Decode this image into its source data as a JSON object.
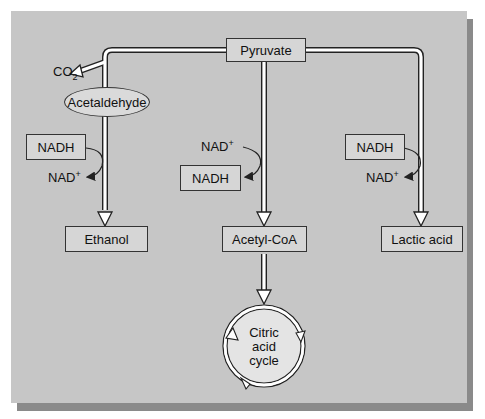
{
  "diagram": {
    "nodes": {
      "pyruvate": "Pyruvate",
      "acetaldehyde": "Acetaldehyde",
      "ethanol": "Ethanol",
      "acetyl_coa": "Acetyl-CoA",
      "lactic_acid": "Lactic acid",
      "citric_acid_cycle": [
        "Citric",
        "acid",
        "cycle"
      ]
    },
    "byproducts": {
      "co2": "CO",
      "co2_sub": "2"
    },
    "cofactors": {
      "left_nadh": "NADH",
      "left_nad": "NAD",
      "middle_nad": "NAD",
      "middle_nadh": "NADH",
      "right_nadh": "NADH",
      "right_nad": "NAD",
      "plus": "+"
    },
    "colors": {
      "background": "#c6c6c6",
      "box_fill": "#d6d6d6",
      "stroke": "#333333",
      "shadow": "#8a8a8a"
    }
  }
}
